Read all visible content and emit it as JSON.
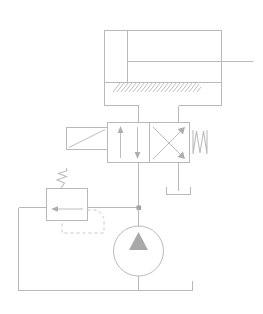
{
  "diagram": {
    "type": "hydraulic-schematic",
    "canvas": {
      "width": 263,
      "height": 314,
      "background": "#ffffff"
    },
    "line_color": "#b9b9b9",
    "accent_color": "#a9a9a9",
    "components": {
      "cylinder": {
        "name": "double-acting-cylinder",
        "label": "",
        "body": {
          "x": 104,
          "y": 30,
          "width": 118,
          "height": 52
        },
        "cap_divider_x": 127,
        "piston_rod_y": 62,
        "rod_end_x": 252,
        "ports": {
          "cap_end_x": 112,
          "rod_end_x": 212
        }
      },
      "mount": {
        "name": "cylinder-ground-mount",
        "hatch_region": {
          "x": 113,
          "y": 83,
          "width": 84,
          "height": 10
        },
        "hatch_count": 22
      },
      "directional_valve": {
        "name": "directional-control-valve",
        "designation": "4/2",
        "body": {
          "x": 107,
          "y": 122,
          "width": 83,
          "height": 40
        },
        "divider_x": 150,
        "left_position_symbol": "parallel-arrows",
        "right_position_symbol": "crossed-arrows",
        "ports_top": [
          138,
          178
        ],
        "ports_bottom": [
          138,
          178
        ]
      },
      "solenoid": {
        "name": "solenoid-actuator",
        "box": {
          "x": 66,
          "y": 127,
          "width": 41,
          "height": 22
        },
        "symbol": "diagonal-slash"
      },
      "valve_spring": {
        "name": "valve-return-spring",
        "symbol": "zigzag",
        "x": 193,
        "y": 130,
        "width": 14,
        "height": 24
      },
      "relief_valve": {
        "name": "pressure-relief-valve",
        "body": {
          "x": 46,
          "y": 188,
          "width": 41,
          "height": 32
        },
        "spring_symbol": "zigzag",
        "arrow_symbol": "up-left-arrow",
        "pilot_line": "dashed"
      },
      "pump": {
        "name": "hydraulic-pump",
        "center": {
          "x": 159,
          "y": 251
        },
        "radius": 25,
        "symbol": "filled-triangle-up",
        "type": "fixed-displacement"
      },
      "tank": {
        "name": "reservoir-tank",
        "line_y": 290,
        "x_start": 18,
        "x_end": 192,
        "stub_height": 10
      },
      "valve_tank_port": {
        "name": "valve-tank-return-symbol",
        "x": 166,
        "y": 190,
        "width": 24,
        "height": 8
      },
      "junction": {
        "name": "pressure-line-junction",
        "x": 159,
        "y": 207,
        "size": 4
      }
    }
  }
}
